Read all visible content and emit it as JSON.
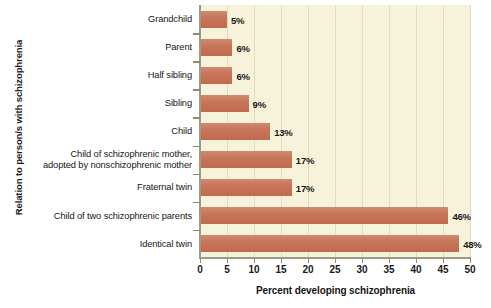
{
  "chart_data": {
    "type": "bar",
    "orientation": "horizontal",
    "title": "",
    "xlabel": "Percent developing schizophrenia",
    "ylabel": "Relation to person/s with schizophrenia",
    "xlim": [
      0,
      50
    ],
    "xticks": [
      0,
      5,
      10,
      15,
      20,
      25,
      30,
      35,
      40,
      45,
      50
    ],
    "xtick_labels": [
      "0",
      "5",
      "10",
      "15",
      "20",
      "25",
      "30",
      "35",
      "40",
      "45",
      "50"
    ],
    "grid": "vertical",
    "legend": "none",
    "categories": [
      "Grandchild",
      "Parent",
      "Half sibling",
      "Sibling",
      "Child",
      "Child of schizophrenic mother, adopted by nonschizophrenic mother",
      "Fraternal twin",
      "Child of two schizophrenic parents",
      "Identical twin"
    ],
    "category_lines": [
      [
        "Grandchild"
      ],
      [
        "Parent"
      ],
      [
        "Half sibling"
      ],
      [
        "Sibling"
      ],
      [
        "Child"
      ],
      [
        "Child of schizophrenic mother,",
        "adopted by nonschizophrenic mother"
      ],
      [
        "Fraternal twin"
      ],
      [
        "Child of two schizophrenic parents"
      ],
      [
        "Identical twin"
      ]
    ],
    "values": [
      5,
      6,
      6,
      9,
      13,
      17,
      17,
      46,
      48
    ],
    "value_labels": [
      "5%",
      "6%",
      "6%",
      "9%",
      "13%",
      "17%",
      "17%",
      "46%",
      "48%"
    ],
    "colors": {
      "bar_light": "#cf8b72",
      "bar_dark": "#c06a4e",
      "plot_background": "#f7f3da",
      "gridline": "#e0dcbd",
      "axis_line": "#9d9a86",
      "page_background": "#ffffff",
      "text": "#171717"
    }
  }
}
